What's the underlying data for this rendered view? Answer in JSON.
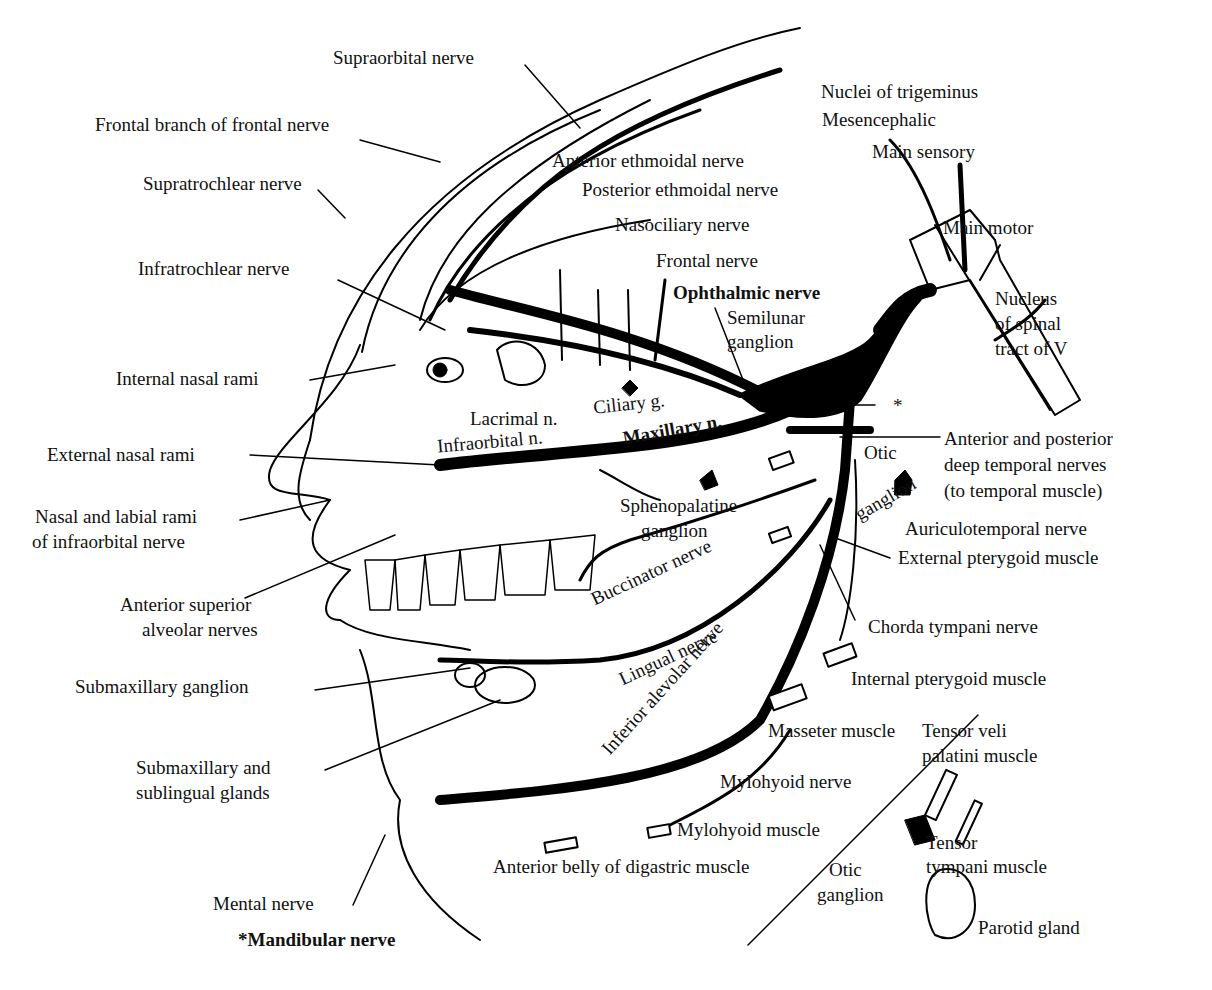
{
  "diagram": {
    "labels": {
      "supraorbital": "Supraorbital nerve",
      "frontal_branch": "Frontal branch of frontal nerve",
      "supratrochlear": "Supratrochlear nerve",
      "infratrochlear": "Infratrochlear nerve",
      "anterior_ethmoidal": "Anterior ethmoidal nerve",
      "posterior_ethmoidal": "Posterior ethmoidal nerve",
      "nasociliary": "Nasociliary nerve",
      "frontal": "Frontal nerve",
      "ophthalmic": "Ophthalmic nerve",
      "semilunar_1": "Semilunar",
      "semilunar_2": "ganglion",
      "nuclei_title": "Nuclei of trigeminus",
      "mesencephalic": "Mesencephalic",
      "main_sensory": "Main sensory",
      "main_motor": "Main motor",
      "spinal_1": "Nucleus",
      "spinal_2": "of spinal",
      "spinal_3": "tract of V",
      "internal_nasal": "Internal nasal rami",
      "ciliary": "Ciliary g.",
      "lacrimal": "Lacrimal n.",
      "infraorbital": "Infraorbital n.",
      "maxillary": "Maxillary n.",
      "asterisk": "*",
      "external_nasal": "External nasal rami",
      "otic_top_1": "Otic",
      "otic_top_2": "ganglion",
      "deep_temporal_1": "Anterior and posterior",
      "deep_temporal_2": "deep temporal nerves",
      "deep_temporal_3": "(to temporal muscle)",
      "nasal_labial_1": "Nasal and labial rami",
      "nasal_labial_2": "of infraorbital nerve",
      "sphenopalatine_1": "Sphenopalatine",
      "sphenopalatine_2": "ganglion",
      "auriculotemporal": "Auriculotemporal nerve",
      "buccinator": "Buccinator nerve",
      "external_pterygoid": "External pterygoid muscle",
      "ant_sup_alveolar_1": "Anterior superior",
      "ant_sup_alveolar_2": "alveolar nerves",
      "chorda_tympani": "Chorda tympani nerve",
      "lingual": "Lingual nerve",
      "inferior_alveolar": "Inferior alevolar nerve",
      "submax_ganglion": "Submaxillary ganglion",
      "internal_pterygoid": "Internal pterygoid muscle",
      "masseter": "Masseter muscle",
      "tensor_veli_1": "Tensor veli",
      "tensor_veli_2": "palatini muscle",
      "submax_glands_1": "Submaxillary and",
      "submax_glands_2": "sublingual glands",
      "mylohyoid_nerve": "Mylohyoid nerve",
      "mylohyoid_muscle": "Mylohyoid muscle",
      "tensor_tympani_1": "Tensor",
      "tensor_tympani_2": "tympani muscle",
      "digastric": "Anterior belly of digastric muscle",
      "otic_bottom_1": "Otic",
      "otic_bottom_2": "ganglion",
      "mental": "Mental nerve",
      "parotid": "Parotid gland",
      "mandibular": "*Mandibular nerve"
    }
  }
}
